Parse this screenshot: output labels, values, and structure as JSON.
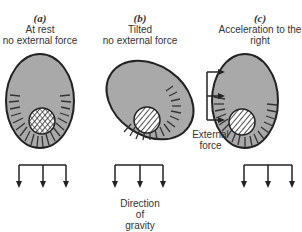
{
  "panels": [
    {
      "letter": "(a)",
      "line1": "At rest",
      "line2": "no external force"
    },
    {
      "letter": "(b)",
      "line1": "Tilted",
      "line2": "no external force"
    },
    {
      "letter": "(c)",
      "line1": "Acceleration to the",
      "line2": "right"
    }
  ],
  "external_force": {
    "line1": "External",
    "line2": "force"
  },
  "gravity": {
    "line1": "Direction",
    "line2": "of",
    "line3": "gravity"
  },
  "colors": {
    "fill": "#a9a9a9",
    "stroke": "#222222"
  }
}
